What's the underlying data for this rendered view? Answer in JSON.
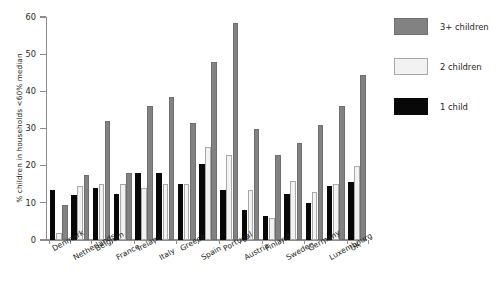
{
  "chart_data": {
    "type": "bar",
    "title": "",
    "subtitle": "",
    "xlabel": "",
    "ylabel": "% children in households <60% median",
    "ylim": [
      0,
      60
    ],
    "yticks": [
      0,
      10,
      20,
      30,
      40,
      50,
      60
    ],
    "grid": false,
    "legend_position": "right",
    "categories": [
      "Denmark",
      "Netherlands",
      "Belgium",
      "France",
      "Ireland",
      "Italy",
      "Greece",
      "Spain",
      "Portugal",
      "Austria",
      "Finland",
      "Sweden",
      "Germany",
      "Luxembourg",
      "UK"
    ],
    "series": [
      {
        "name": "1 child",
        "color": "#080808",
        "values": [
          13.5,
          12.0,
          14.0,
          12.5,
          18.0,
          18.0,
          15.0,
          20.5,
          13.5,
          8.0,
          6.5,
          12.5,
          10.0,
          14.5,
          15.5
        ]
      },
      {
        "name": "2 children",
        "color": "#f2f2f2",
        "values": [
          2.0,
          14.5,
          15.0,
          15.0,
          14.0,
          15.0,
          15.0,
          25.0,
          23.0,
          13.5,
          6.0,
          16.0,
          13.0,
          15.0,
          20.0
        ]
      },
      {
        "name": "3+ children",
        "color": "#828282",
        "values": [
          9.5,
          17.5,
          32.0,
          18.0,
          36.0,
          38.5,
          31.5,
          48.0,
          58.5,
          30.0,
          23.0,
          26.0,
          31.0,
          36.0,
          44.5
        ]
      }
    ]
  },
  "legend": {
    "entries": [
      {
        "label": "3+ children",
        "swatch": "c3"
      },
      {
        "label": "2 children",
        "swatch": "c2"
      },
      {
        "label": "1 child",
        "swatch": "c1"
      }
    ]
  },
  "axes": {
    "y_title": "% children in households <60% median",
    "y_tick_labels": [
      "0",
      "10",
      "20",
      "30",
      "40",
      "50",
      "60"
    ]
  }
}
